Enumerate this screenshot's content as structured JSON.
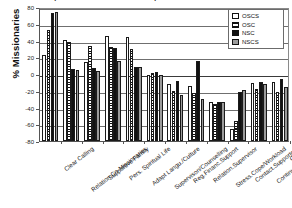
{
  "chart_data": {
    "type": "bar",
    "title": "Reported Reasons for Missionary Attrition and Retention",
    "ylabel": "% Missionaries",
    "xlabel": "",
    "ylim": [
      -80,
      80
    ],
    "yticks": [
      80,
      60,
      40,
      20,
      0,
      -20,
      -40,
      -60,
      -80
    ],
    "ytick_labels": [
      "80",
      "60",
      "40",
      "20",
      "0",
      "-20",
      "-40",
      "-60",
      "-80"
    ],
    "grid": true,
    "legend_position": "top-right",
    "categories": [
      "Clear Calling",
      "Relation.Co-Missionaries",
      "Supportive Family",
      "Pers. Spiritual Life",
      "Adapt Langu./Culture",
      "Supervison/Counselling",
      "Reg.Financ.Support",
      "Relation.Supervisor",
      "Stress.Cope/Workload",
      "Contact.Supporters",
      "Continuous.Training",
      "Others"
    ],
    "series": [
      {
        "name": "OSCS",
        "color": "#ffffff",
        "pattern": "empty",
        "values": [
          23,
          41,
          14,
          45,
          44,
          -1,
          -12,
          -14,
          -34,
          -66,
          -11,
          -10
        ]
      },
      {
        "name": "OSC",
        "color": "#ffffff",
        "pattern": "horizontal-hatch",
        "values": [
          52,
          38,
          33,
          32,
          30,
          1,
          -20,
          -23,
          -36,
          -56,
          -18,
          -22
        ]
      },
      {
        "name": "NSC",
        "color": "#111111",
        "pattern": "solid",
        "values": [
          73,
          6,
          7,
          31,
          8,
          3,
          -8,
          15,
          -33,
          -21,
          -9,
          -6
        ]
      },
      {
        "name": "NSCS",
        "color": "#9b9b9b",
        "pattern": "gray",
        "values": [
          74,
          5,
          4,
          15,
          8,
          -1,
          -25,
          -30,
          -33,
          -19,
          -12,
          -15
        ]
      }
    ]
  },
  "legend": {
    "items": [
      {
        "label": "OSCS"
      },
      {
        "label": "OSC"
      },
      {
        "label": "NSC"
      },
      {
        "label": "NSCS"
      }
    ]
  }
}
